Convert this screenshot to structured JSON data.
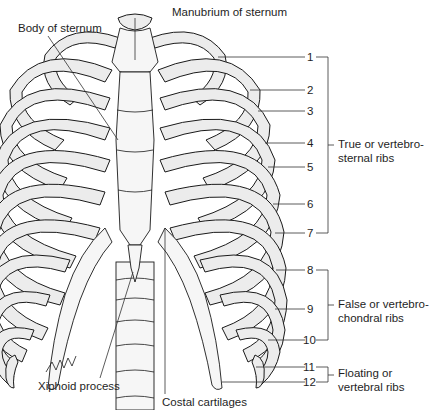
{
  "figure": {
    "colors": {
      "bone_fill": "#ececec",
      "outline": "#1a1a1a",
      "text": "#1e1e1e",
      "leader": "#333333"
    }
  },
  "labels": {
    "manubrium": {
      "text": "Manubrium of sternum",
      "x": 172,
      "y": 6
    },
    "body": {
      "text": "Body of sternum",
      "x": 18,
      "y": 22
    },
    "xiphoid": {
      "text": "Xiphoid process",
      "x": 38,
      "y": 380
    },
    "costal": {
      "text": "Costal cartilages",
      "x": 162,
      "y": 396
    }
  },
  "ribs": [
    {
      "number": "1",
      "y": 57
    },
    {
      "number": "2",
      "y": 90
    },
    {
      "number": "3",
      "y": 111
    },
    {
      "number": "4",
      "y": 143
    },
    {
      "number": "5",
      "y": 167
    },
    {
      "number": "6",
      "y": 204
    },
    {
      "number": "7",
      "y": 233
    },
    {
      "number": "8",
      "y": 270
    },
    {
      "number": "9",
      "y": 309
    },
    {
      "number": "10",
      "y": 340
    },
    {
      "number": "11",
      "y": 367
    },
    {
      "number": "12",
      "y": 382
    }
  ],
  "groups": [
    {
      "label": "True or vertebro-\nsternal ribs",
      "from": 1,
      "to": 7,
      "y_top": 57,
      "y_bottom": 233,
      "text_y": 137
    },
    {
      "label": "False or vertebro-\nchondral ribs",
      "from": 8,
      "to": 10,
      "y_top": 270,
      "y_bottom": 340,
      "text_y": 297
    },
    {
      "label": "Floating or\nvertebral ribs",
      "from": 11,
      "to": 12,
      "y_top": 367,
      "y_bottom": 382,
      "text_y": 366
    }
  ]
}
